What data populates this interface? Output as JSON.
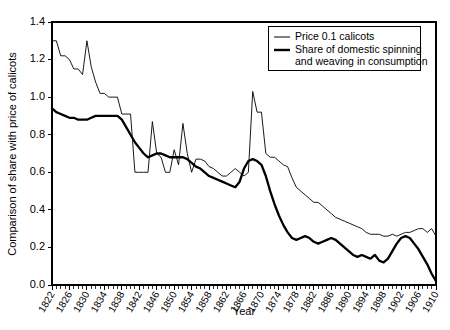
{
  "chart_data": {
    "type": "line",
    "title": "",
    "xlabel": "Year",
    "ylabel": "Comparison of share with price of calicots",
    "xlim": [
      1822,
      1910
    ],
    "ylim": [
      0.0,
      1.4
    ],
    "grid": false,
    "legend_position": "top-right",
    "y_ticks": [
      "0.0",
      "0.2",
      "0.4",
      "0.6",
      "0.8",
      "1.0",
      "1.2",
      "1.4"
    ],
    "y_tick_values": [
      0.0,
      0.2,
      0.4,
      0.6,
      0.8,
      1.0,
      1.2,
      1.4
    ],
    "x_ticks": [
      "1822",
      "1826",
      "1830",
      "1834",
      "1838",
      "1842",
      "1846",
      "1850",
      "1854",
      "1858",
      "1862",
      "1866",
      "1870",
      "1874",
      "1878",
      "1882",
      "1886",
      "1890",
      "1894",
      "1898",
      "1902",
      "1906",
      "1910"
    ],
    "x_tick_values": [
      1822,
      1826,
      1830,
      1834,
      1838,
      1842,
      1846,
      1850,
      1854,
      1858,
      1862,
      1866,
      1870,
      1874,
      1878,
      1882,
      1886,
      1890,
      1894,
      1898,
      1902,
      1906,
      1910
    ],
    "x_minor_step": 1,
    "x": [
      1822,
      1823,
      1824,
      1825,
      1826,
      1827,
      1828,
      1829,
      1830,
      1831,
      1832,
      1833,
      1834,
      1835,
      1836,
      1837,
      1838,
      1839,
      1840,
      1841,
      1842,
      1843,
      1844,
      1845,
      1846,
      1847,
      1848,
      1849,
      1850,
      1851,
      1852,
      1853,
      1854,
      1855,
      1856,
      1857,
      1858,
      1859,
      1860,
      1861,
      1862,
      1863,
      1864,
      1865,
      1866,
      1867,
      1868,
      1869,
      1870,
      1871,
      1872,
      1873,
      1874,
      1875,
      1876,
      1877,
      1878,
      1879,
      1880,
      1881,
      1882,
      1883,
      1884,
      1885,
      1886,
      1887,
      1888,
      1889,
      1890,
      1891,
      1892,
      1893,
      1894,
      1895,
      1896,
      1897,
      1898,
      1899,
      1900,
      1901,
      1902,
      1903,
      1904,
      1905,
      1906,
      1907,
      1908,
      1909,
      1910
    ],
    "series": [
      {
        "name": "Price 0.1 calicots",
        "style": "thin",
        "color": "#000000",
        "values": [
          1.3,
          1.3,
          1.22,
          1.22,
          1.2,
          1.15,
          1.15,
          1.12,
          1.3,
          1.16,
          1.08,
          1.02,
          1.02,
          1.0,
          1.0,
          1.0,
          0.91,
          0.91,
          0.91,
          0.6,
          0.6,
          0.6,
          0.6,
          0.87,
          0.7,
          0.68,
          0.6,
          0.6,
          0.72,
          0.64,
          0.86,
          0.7,
          0.6,
          0.67,
          0.67,
          0.66,
          0.63,
          0.62,
          0.6,
          0.58,
          0.58,
          0.6,
          0.62,
          0.6,
          0.58,
          0.6,
          1.03,
          0.92,
          0.92,
          0.7,
          0.68,
          0.68,
          0.66,
          0.64,
          0.63,
          0.57,
          0.52,
          0.5,
          0.48,
          0.46,
          0.44,
          0.44,
          0.42,
          0.4,
          0.38,
          0.36,
          0.35,
          0.34,
          0.33,
          0.32,
          0.31,
          0.3,
          0.28,
          0.27,
          0.27,
          0.27,
          0.26,
          0.26,
          0.27,
          0.26,
          0.27,
          0.28,
          0.28,
          0.29,
          0.3,
          0.3,
          0.28,
          0.3,
          0.26
        ]
      },
      {
        "name": "Share of domestic spinning and weaving in consumption",
        "style": "thick",
        "color": "#000000",
        "values": [
          0.94,
          0.92,
          0.91,
          0.9,
          0.89,
          0.89,
          0.88,
          0.88,
          0.88,
          0.89,
          0.9,
          0.9,
          0.9,
          0.9,
          0.9,
          0.9,
          0.88,
          0.84,
          0.8,
          0.76,
          0.73,
          0.7,
          0.68,
          0.69,
          0.7,
          0.7,
          0.69,
          0.68,
          0.68,
          0.68,
          0.68,
          0.67,
          0.65,
          0.63,
          0.62,
          0.6,
          0.58,
          0.57,
          0.56,
          0.55,
          0.54,
          0.53,
          0.52,
          0.55,
          0.62,
          0.66,
          0.67,
          0.66,
          0.64,
          0.58,
          0.5,
          0.43,
          0.37,
          0.32,
          0.28,
          0.25,
          0.24,
          0.25,
          0.26,
          0.25,
          0.23,
          0.22,
          0.23,
          0.24,
          0.25,
          0.24,
          0.22,
          0.2,
          0.18,
          0.16,
          0.15,
          0.16,
          0.15,
          0.14,
          0.16,
          0.13,
          0.12,
          0.14,
          0.18,
          0.22,
          0.25,
          0.26,
          0.25,
          0.22,
          0.19,
          0.15,
          0.11,
          0.06,
          0.02
        ]
      }
    ]
  },
  "legend": {
    "entries": [
      {
        "label": "Price 0.1 calicots",
        "style": "thin"
      },
      {
        "label": "Share of domestic spinning",
        "style": "thick"
      },
      {
        "label": "and weaving in consumption",
        "style": "none"
      }
    ]
  }
}
